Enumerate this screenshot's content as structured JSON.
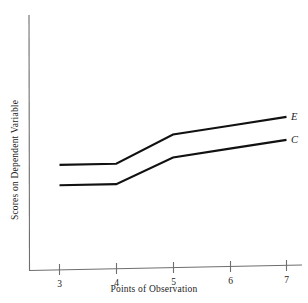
{
  "chart_data": {
    "type": "line",
    "title": "",
    "xlabel": "Points of Observation",
    "ylabel": "Scores on Dependent Variable",
    "x": [
      3,
      4,
      5,
      6,
      7
    ],
    "xticklabels": [
      "3",
      "4",
      "5",
      "6",
      "7"
    ],
    "xlim": [
      2.8,
      7.25
    ],
    "ylim": [
      0,
      10
    ],
    "yticklabels": [],
    "grid": false,
    "legend_position": "right-end-of-line",
    "annotations": [
      "E",
      "C"
    ],
    "series": [
      {
        "name": "E",
        "label": "E",
        "color": "#111111",
        "values": [
          4.1,
          4.1,
          5.2,
          5.5,
          5.8
        ]
      },
      {
        "name": "C",
        "label": "C",
        "color": "#111111",
        "values": [
          3.3,
          3.3,
          4.3,
          4.6,
          4.9
        ]
      }
    ]
  },
  "axes": {
    "x_tick_labels": [
      "3",
      "4",
      "5",
      "6",
      "7"
    ],
    "x_axis_title": "Points of Observation",
    "y_axis_title": "Scores on Dependent Variable"
  },
  "labels": {
    "series_e": "E",
    "series_c": "C"
  },
  "colors": {
    "background": "#ffffff",
    "axis": "#6e6e6e",
    "line": "#111111",
    "text": "#1c1c1c"
  }
}
